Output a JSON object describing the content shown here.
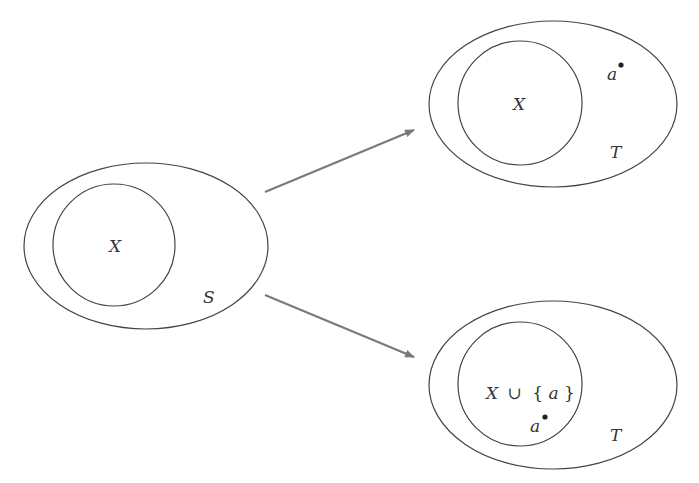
{
  "diagram": {
    "type": "set-extension",
    "colors": {
      "outline": "#444444",
      "arrow": "#7a7a7a",
      "text": "#333333",
      "background": "#ffffff"
    },
    "left": {
      "outer_label": "S",
      "inner_label": "X"
    },
    "top_right": {
      "outer_label": "T",
      "inner_label": "X",
      "point_label": "a"
    },
    "bottom_right": {
      "outer_label": "T",
      "inner_label_parts": {
        "x": "X",
        "union": "∪",
        "open": "{",
        "a": "a",
        "close": "}"
      },
      "point_label": "a"
    },
    "arrows": [
      {
        "from": "left",
        "to": "top_right"
      },
      {
        "from": "left",
        "to": "bottom_right"
      }
    ]
  }
}
